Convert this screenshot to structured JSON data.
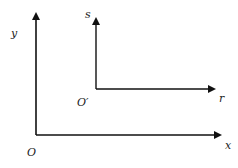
{
  "diagram": {
    "frames": [
      {
        "origin_label": "O",
        "horizontal_axis": "x",
        "vertical_axis": "y"
      },
      {
        "origin_label": "O′",
        "horizontal_axis": "r",
        "vertical_axis": "s"
      }
    ],
    "labels": {
      "y": "y",
      "x": "x",
      "o": "O",
      "s": "s",
      "r": "r",
      "o_prime": "O′"
    },
    "colors": {
      "axis": "#111111",
      "text": "#222222"
    }
  }
}
